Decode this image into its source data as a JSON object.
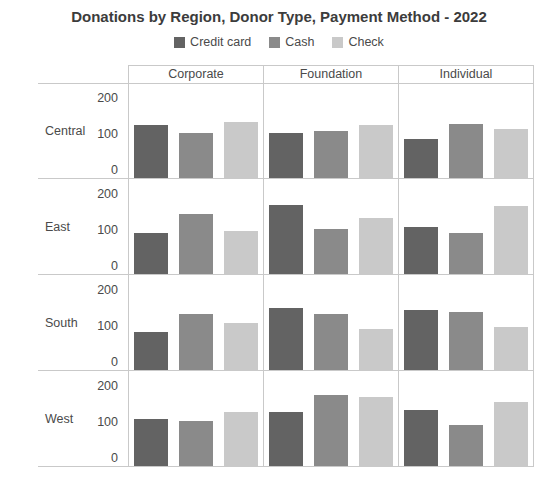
{
  "chart_data": {
    "type": "bar",
    "title": "Donations by Region, Donor Type, Payment Method - 2022",
    "facet_rows": [
      "Central",
      "East",
      "South",
      "West"
    ],
    "facet_cols": [
      "Corporate",
      "Foundation",
      "Individual"
    ],
    "series": [
      {
        "name": "Credit card",
        "color": "#636363"
      },
      {
        "name": "Cash",
        "color": "#8a8a8a"
      },
      {
        "name": "Check",
        "color": "#c9c9c9"
      }
    ],
    "yticks": [
      0,
      100,
      200
    ],
    "ylim": [
      0,
      250
    ],
    "grid": "facet-borders",
    "legend_position": "top",
    "values": {
      "Central": {
        "Corporate": [
          140,
          120,
          150
        ],
        "Foundation": [
          120,
          125,
          140
        ],
        "Individual": [
          105,
          145,
          130
        ]
      },
      "East": {
        "Corporate": [
          110,
          160,
          115
        ],
        "Foundation": [
          185,
          120,
          150
        ],
        "Individual": [
          125,
          110,
          180
        ]
      },
      "South": {
        "Corporate": [
          100,
          150,
          125
        ],
        "Foundation": [
          165,
          150,
          110
        ],
        "Individual": [
          160,
          155,
          115
        ]
      },
      "West": {
        "Corporate": [
          125,
          120,
          145
        ],
        "Foundation": [
          145,
          190,
          185
        ],
        "Individual": [
          150,
          110,
          170
        ]
      }
    }
  }
}
